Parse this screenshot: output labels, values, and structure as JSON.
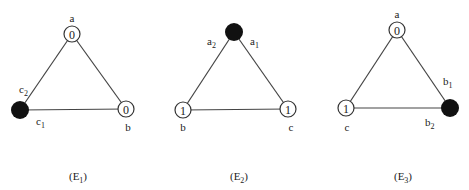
{
  "diagrams": [
    {
      "caption": "(E",
      "caption_sub": "1",
      "caption_end": ")",
      "nodes": [
        {
          "id": "a",
          "label": "a",
          "value": "0",
          "filled": false
        },
        {
          "id": "b",
          "label": "b",
          "value": "0",
          "filled": false
        },
        {
          "id": "c",
          "label": "c1",
          "value": "",
          "filled": true
        }
      ],
      "labels": {
        "top": "a",
        "right": "b",
        "c1": "c",
        "c1_sub": "1",
        "c2": "c",
        "c2_sub": "2",
        "v_a": "0",
        "v_b": "0"
      }
    },
    {
      "caption": "(E",
      "caption_sub": "2",
      "caption_end": ")",
      "labels": {
        "a1": "a",
        "a1_sub": "1",
        "a2": "a",
        "a2_sub": "2",
        "left": "b",
        "right": "c",
        "v_b": "1",
        "v_c": "1"
      }
    },
    {
      "caption": "(E",
      "caption_sub": "3",
      "caption_end": ")",
      "labels": {
        "top": "a",
        "left": "c",
        "b1": "b",
        "b1_sub": "1",
        "b2": "b",
        "b2_sub": "2",
        "v_a": "0",
        "v_c": "1"
      }
    }
  ]
}
